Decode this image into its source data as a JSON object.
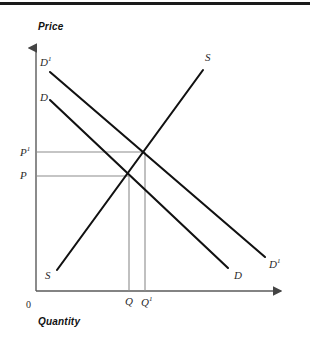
{
  "figure": {
    "kind": "supply-and-demand-diagram",
    "top_rule": true,
    "background_color": "#ffffff",
    "curve_color": "#111111",
    "guide_color": "#8c8c8c",
    "axis_color": "#555555"
  },
  "axes": {
    "y_title": "Price",
    "x_title": "Quantity",
    "origin_label": "0",
    "y_axis": {
      "x": 36,
      "top": 44,
      "bottom": 291,
      "arrow": "up"
    },
    "x_axis": {
      "y": 291,
      "left": 36,
      "right": 286,
      "arrow": "right"
    }
  },
  "price_ticks": [
    {
      "id": "p1",
      "label": "P",
      "superscript": "1",
      "y": 152
    },
    {
      "id": "p",
      "label": "P",
      "superscript": "",
      "y": 176
    }
  ],
  "quantity_ticks": [
    {
      "id": "q",
      "label": "Q",
      "superscript": "",
      "x": 129
    },
    {
      "id": "q1",
      "label": "Q",
      "superscript": "1",
      "x": 145
    }
  ],
  "curves": [
    {
      "id": "supply",
      "label": "S",
      "superscript": "",
      "start_label": "S",
      "x1": 57,
      "y1": 270,
      "x2": 203,
      "y2": 70
    },
    {
      "id": "demand",
      "label": "D",
      "superscript": "",
      "x1": 50,
      "y1": 100,
      "x2": 228,
      "y2": 268
    },
    {
      "id": "demand-shifted",
      "label": "D",
      "superscript": "1",
      "x1": 50,
      "y1": 72,
      "x2": 265,
      "y2": 257
    }
  ],
  "equilibria": [
    {
      "id": "e0",
      "x": 129,
      "y": 176,
      "price": "P",
      "quantity": "Q"
    },
    {
      "id": "e1",
      "x": 145,
      "y": 152,
      "price": "P1",
      "quantity": "Q1"
    }
  ],
  "labels": {
    "price_axis_title": "Price",
    "quantity_axis_title": "Quantity",
    "origin": "0",
    "supply_top": "S",
    "supply_bottom": "S",
    "demand_left": "D",
    "demand_right": "D",
    "demand_shift_left": "D",
    "demand_shift_right": "D",
    "superscript_one": "1",
    "price_base": "P",
    "price_shift": "P",
    "quantity_base": "Q",
    "quantity_shift": "Q"
  }
}
